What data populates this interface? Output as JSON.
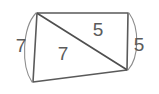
{
  "figure": {
    "type": "geometry-diagram",
    "shape": "quadrilateral-with-diagonal",
    "background_color": "#ffffff",
    "stroke_color": "#5a5a5a",
    "label_color": "#5b5b5b",
    "arc_color": "#8c8c8c",
    "labels": {
      "left_side": "7",
      "right_side": "5",
      "upper_triangle": "5",
      "lower_triangle": "7"
    },
    "vertices": {
      "top_left": [
        37,
        13
      ],
      "top_right": [
        128,
        13
      ],
      "lower_right": [
        127,
        70
      ],
      "bottom_left": [
        33,
        82
      ]
    }
  }
}
